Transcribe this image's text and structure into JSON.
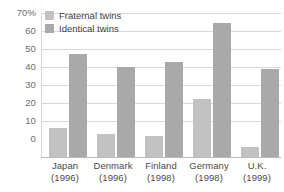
{
  "chart_data": {
    "type": "bar",
    "title": "",
    "xlabel": "",
    "ylabel": "",
    "ylim": [
      0,
      70
    ],
    "yticks": [
      0,
      10,
      20,
      30,
      40,
      50,
      60,
      70
    ],
    "ytick_labels": [
      "0",
      "10",
      "20",
      "30",
      "40",
      "50",
      "60",
      "70%"
    ],
    "grid": true,
    "legend_position": "top-left",
    "categories": [
      "Japan",
      "Denmark",
      "Finland",
      "Germany",
      "U.K."
    ],
    "category_years": [
      "(1996)",
      "(1996)",
      "(1998)",
      "(1998)",
      "(1999)"
    ],
    "series": [
      {
        "name": "Fraternal twins",
        "color": "#c2c2c2",
        "values": [
          14,
          11,
          10,
          28,
          5
        ]
      },
      {
        "name": "Identical twins",
        "color": "#a9a9a9",
        "values": [
          50,
          44,
          46,
          65,
          43
        ]
      }
    ]
  },
  "legend": {
    "items": [
      {
        "label": "Fraternal twins"
      },
      {
        "label": "Identical twins"
      }
    ]
  }
}
